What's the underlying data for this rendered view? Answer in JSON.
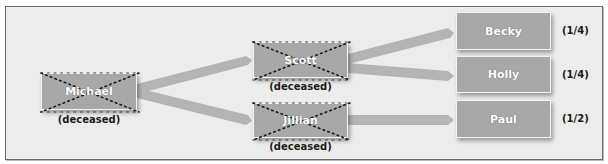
{
  "diagram": {
    "type": "inheritance-flow",
    "nodes": {
      "michael": {
        "name": "Michael",
        "note": "(deceased)",
        "deceased": true
      },
      "scott": {
        "name": "Scott",
        "note": "(deceased)",
        "deceased": true
      },
      "jillian": {
        "name": "Jillian",
        "note": "(deceased)",
        "deceased": true
      },
      "becky": {
        "name": "Becky",
        "share": "(1/4)",
        "deceased": false
      },
      "holly": {
        "name": "Holly",
        "share": "(1/4)",
        "deceased": false
      },
      "paul": {
        "name": "Paul",
        "share": "(1/2)",
        "deceased": false
      }
    },
    "edges": [
      {
        "from": "Michael",
        "to": "Scott"
      },
      {
        "from": "Michael",
        "to": "Jillian"
      },
      {
        "from": "Scott",
        "to": "Becky"
      },
      {
        "from": "Scott",
        "to": "Holly"
      },
      {
        "from": "Jillian",
        "to": "Paul"
      }
    ],
    "colors": {
      "background": "#ececec",
      "node_fill": "#a8a8a8",
      "connector": "#b4b4b4",
      "cross_dots": "#1a1a1a",
      "text_dark": "#1a1a1a"
    }
  }
}
